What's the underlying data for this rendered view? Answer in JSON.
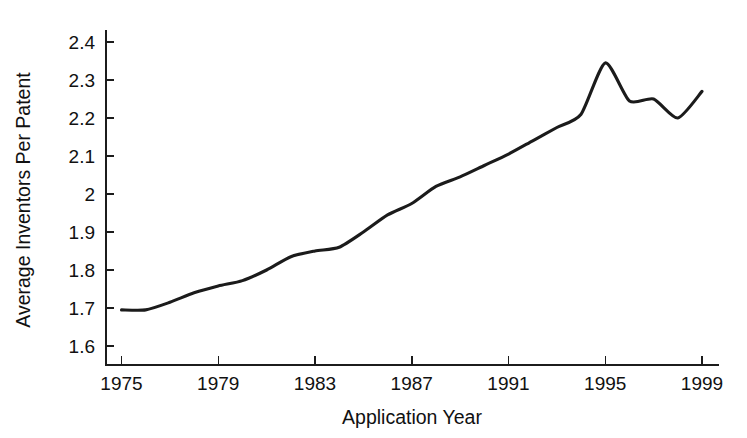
{
  "chart_data": {
    "type": "line",
    "title": "",
    "xlabel": "Application Year",
    "ylabel": "Average Inventors Per Patent",
    "xlim": [
      1975,
      1999.8
    ],
    "ylim": [
      1.555,
      2.42
    ],
    "grid": false,
    "legend": null,
    "line_color": "#1b1b1b",
    "x_tick_labels": [
      "1975",
      "1979",
      "1983",
      "1987",
      "1991",
      "1995",
      "1999"
    ],
    "x_tick_values": [
      1975,
      1979,
      1983,
      1987,
      1991,
      1995,
      1999
    ],
    "x_minor_ticks": [
      1976,
      1977,
      1978,
      1980,
      1981,
      1982,
      1984,
      1985,
      1986,
      1988,
      1989,
      1990,
      1992,
      1993,
      1994,
      1996,
      1997,
      1998
    ],
    "y_tick_labels": [
      "1.6",
      "1.7",
      "1.8",
      "1.9",
      "2",
      "2.1",
      "2.2",
      "2.3",
      "2.4"
    ],
    "y_tick_values": [
      1.6,
      1.7,
      1.8,
      1.9,
      2.0,
      2.1,
      2.2,
      2.3,
      2.4
    ],
    "x": [
      1975,
      1976,
      1977,
      1978,
      1979,
      1980,
      1981,
      1982,
      1983,
      1984,
      1985,
      1986,
      1987,
      1988,
      1989,
      1990,
      1991,
      1992,
      1993,
      1994,
      1995,
      1996,
      1997,
      1998,
      1999
    ],
    "values": [
      1.695,
      1.695,
      1.715,
      1.74,
      1.758,
      1.772,
      1.8,
      1.835,
      1.85,
      1.86,
      1.9,
      1.945,
      1.975,
      2.02,
      2.045,
      2.075,
      2.105,
      2.14,
      2.175,
      2.21,
      2.345,
      2.245,
      2.25,
      2.2,
      2.27
    ],
    "series": [
      {
        "name": "Average Inventors Per Patent",
        "values": [
          1.695,
          1.695,
          1.715,
          1.74,
          1.758,
          1.772,
          1.8,
          1.835,
          1.85,
          1.86,
          1.9,
          1.945,
          1.975,
          2.02,
          2.045,
          2.075,
          2.105,
          2.14,
          2.175,
          2.21,
          2.345,
          2.245,
          2.25,
          2.2,
          2.27
        ]
      }
    ]
  }
}
